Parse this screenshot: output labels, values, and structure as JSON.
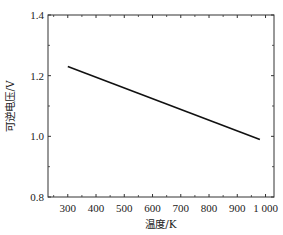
{
  "chart_data": {
    "type": "line",
    "title": "",
    "xlabel": "温度/K",
    "ylabel": "可逆电压/V",
    "xlim": [
      230,
      1030
    ],
    "ylim": [
      0.8,
      1.4
    ],
    "xticks": [
      300,
      400,
      500,
      600,
      700,
      800,
      900,
      1000
    ],
    "xtick_labels": [
      "300",
      "400",
      "500",
      "600",
      "700",
      "800",
      "900",
      "1 000"
    ],
    "yticks": [
      0.8,
      1.0,
      1.2,
      1.4
    ],
    "ytick_labels": [
      "0.8",
      "1.0",
      "1.2",
      "1.4"
    ],
    "grid": false,
    "series": [
      {
        "name": "可逆电压",
        "x": [
          300,
          980
        ],
        "y": [
          1.23,
          0.99
        ],
        "color": "#111111"
      }
    ]
  }
}
